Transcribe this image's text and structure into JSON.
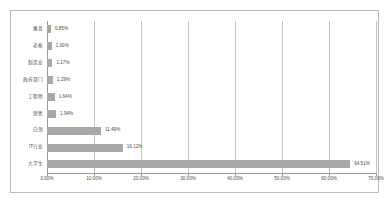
{
  "chart_data": {
    "type": "bar",
    "orientation": "horizontal",
    "title": "",
    "xlabel": "",
    "ylabel": "",
    "xlim": [
      0,
      70
    ],
    "xticks": [
      "0.00%",
      "10.00%",
      "20.00%",
      "30.00%",
      "40.00%",
      "50.00%",
      "60.00%",
      "70.00%"
    ],
    "grid": true,
    "legend": false,
    "bar_color": "#a8a8a8",
    "categories": [
      "教育",
      "老板",
      "制造业",
      "政府部门",
      "工程师",
      "销售",
      "白领",
      "IT行业",
      "大学生"
    ],
    "values": [
      0.85,
      1.0,
      1.17,
      1.29,
      1.64,
      1.94,
      11.49,
      16.12,
      64.51
    ],
    "value_labels": [
      "0.85%",
      "1.00%",
      "1.17%",
      "1.29%",
      "1.64%",
      "1.94%",
      "11.49%",
      "16.12%",
      "64.51%"
    ]
  },
  "colors": {
    "frame_border": "#b9b9b9",
    "gridline": "#c4c4c4",
    "axis": "#9a9a9a",
    "text": "#4a4a4a",
    "background": "#ffffff"
  }
}
